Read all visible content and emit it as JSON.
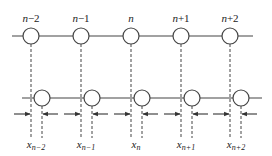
{
  "diagram": {
    "colors": {
      "stroke": "#444444",
      "background": "#ffffff"
    },
    "top_row": {
      "y": 36,
      "line": {
        "x1": 12,
        "x2": 253
      },
      "nodes": [
        {
          "x": 31,
          "label_var": "n",
          "label_suffix": "−2"
        },
        {
          "x": 81,
          "label_var": "n",
          "label_suffix": "−1"
        },
        {
          "x": 131,
          "label_var": "n",
          "label_suffix": ""
        },
        {
          "x": 181,
          "label_var": "n",
          "label_suffix": "+1"
        },
        {
          "x": 230,
          "label_var": "n",
          "label_suffix": "+2"
        }
      ]
    },
    "bottom_row": {
      "y": 98,
      "line": {
        "x1": 22,
        "x2": 262
      },
      "nodes": [
        {
          "x": 42,
          "label_var": "x",
          "label_sub": "n−2"
        },
        {
          "x": 92,
          "label_var": "x",
          "label_sub": "n−1"
        },
        {
          "x": 142,
          "label_var": "x",
          "label_sub": "n"
        },
        {
          "x": 192,
          "label_var": "x",
          "label_sub": "n+1"
        },
        {
          "x": 241,
          "label_var": "x",
          "label_sub": "n+2"
        }
      ]
    },
    "labels": {
      "top": [
        "n−2",
        "n−1",
        "n",
        "n+1",
        "n+2"
      ],
      "bottom": [
        "x_{n−2}",
        "x_{n−1}",
        "x_n",
        "x_{n+1}",
        "x_{n+2}"
      ]
    }
  }
}
